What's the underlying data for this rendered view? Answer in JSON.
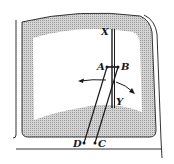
{
  "diagram": {
    "labels": {
      "X": "X",
      "A": "A",
      "B": "B",
      "Y": "Y",
      "D": "D",
      "C": "C"
    },
    "colors": {
      "ink": "#1a1a1a",
      "frame_shade": "#bdbdbd",
      "glass": "#ffffff"
    }
  }
}
